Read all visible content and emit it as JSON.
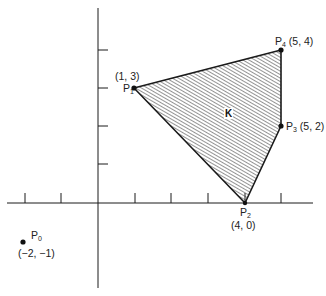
{
  "diagram": {
    "title": "",
    "region_label": "K",
    "axes": {
      "x_ticks": [
        -2,
        -1,
        1,
        2,
        3,
        4,
        5
      ],
      "y_ticks": [
        1,
        2,
        3,
        4
      ]
    },
    "points": [
      {
        "name": "P",
        "sub": "0",
        "coord": "(−2, −1)",
        "x": -2,
        "y": -1
      },
      {
        "name": "P",
        "sub": "1",
        "coord": "(1, 3)",
        "x": 1,
        "y": 3
      },
      {
        "name": "P",
        "sub": "2",
        "coord": "(4, 0)",
        "x": 4,
        "y": 0
      },
      {
        "name": "P",
        "sub": "3",
        "coord": "(5, 2)",
        "x": 5,
        "y": 2
      },
      {
        "name": "P",
        "sub": "4",
        "coord": "(5, 4)",
        "x": 5,
        "y": 4
      }
    ],
    "polygon_vertices": [
      "P1",
      "P4",
      "P3",
      "P2"
    ],
    "colors": {
      "line": "#1a1a1a",
      "hatch": "#333333",
      "background": "#ffffff"
    }
  }
}
